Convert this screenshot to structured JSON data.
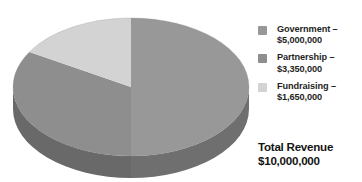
{
  "chart_data": {
    "type": "pie",
    "title": "",
    "subtitle": "",
    "xlabel": "",
    "ylabel": "",
    "legend_position": "right",
    "grid": false,
    "three_d": true,
    "categories": [
      "Government",
      "Partnership",
      "Fundraising"
    ],
    "values": [
      5000000,
      3350000,
      1650000
    ],
    "percentages": [
      50.0,
      33.5,
      16.5
    ],
    "value_labels": [
      "$5,000,000",
      "$3,350,000",
      "$1,650,000"
    ],
    "colors": [
      "#989898",
      "#8e8e8e",
      "#d3d3d3"
    ],
    "total": 10000000,
    "total_label": "$10,000,000",
    "start_angle_deg": 0,
    "direction": "clockwise"
  },
  "legend": {
    "items": [
      {
        "swatch_name": "government-swatch",
        "color": "#989898",
        "name_line": "Government –",
        "value_line": "$5,000,000"
      },
      {
        "swatch_name": "partnership-swatch",
        "color": "#8e8e8e",
        "name_line": "Partnership –",
        "value_line": "$3,350,000"
      },
      {
        "swatch_name": "fundraising-swatch",
        "color": "#d3d3d3",
        "name_line": "Fundraising –",
        "value_line": "$1,650,000"
      }
    ]
  },
  "total": {
    "caption": "Total Revenue",
    "amount": "$10,000,000"
  },
  "style": {
    "pie_side_color": "#6e6e6e",
    "government_side_color": "#6f6f6f",
    "partnership_side_color": "#696969",
    "background": "#ffffff"
  }
}
